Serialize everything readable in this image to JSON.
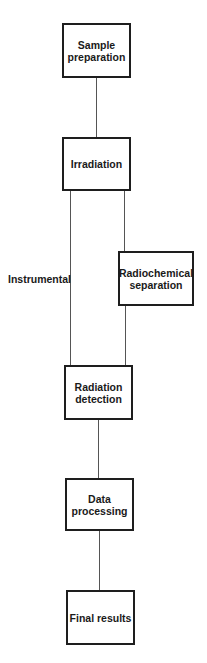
{
  "diagram": {
    "type": "flowchart",
    "direction": "top-to-bottom",
    "nodes": [
      {
        "id": "sample_preparation",
        "label": "Sample\npreparation"
      },
      {
        "id": "irradiation",
        "label": "Irradiation"
      },
      {
        "id": "radiochemical_separation",
        "label": "Radiochemical\nseparation"
      },
      {
        "id": "radiation_detection",
        "label": "Radiation\ndetection"
      },
      {
        "id": "data_processing",
        "label": "Data\nprocessing"
      },
      {
        "id": "final_results",
        "label": "Final results"
      }
    ],
    "edges": [
      {
        "from": "sample_preparation",
        "to": "irradiation"
      },
      {
        "from": "irradiation",
        "to": "radiation_detection",
        "label": "Instrumental"
      },
      {
        "from": "irradiation",
        "to": "radiochemical_separation"
      },
      {
        "from": "radiochemical_separation",
        "to": "radiation_detection"
      },
      {
        "from": "radiation_detection",
        "to": "data_processing"
      },
      {
        "from": "data_processing",
        "to": "final_results"
      }
    ],
    "path_labels": {
      "instrumental": "Instrumental"
    },
    "colors": {
      "box_border": "#1e1e1e",
      "connector": "#555555",
      "text": "#1a1a1a",
      "background": "#ffffff"
    }
  }
}
